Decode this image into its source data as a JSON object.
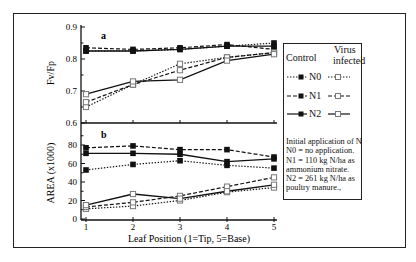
{
  "figure": {
    "panel_a_label": "a",
    "panel_b_label": "b",
    "ylabel_a": "Fv/Fp",
    "ylabel_b": "AREA (x1000)",
    "xlabel": "Leaf Position (1=Tip, 5=Base)"
  },
  "legend": {
    "control_header": "Control",
    "virus_header_line1": "Virus",
    "virus_header_line2": "infected",
    "rows": [
      {
        "label": "N0",
        "style": "dotted"
      },
      {
        "label": "N1",
        "style": "dash-dot"
      },
      {
        "label": "N2",
        "style": "solid"
      }
    ],
    "notes": [
      "Initial application of N",
      "N0 = no application.",
      "N1 = 110 kg N/ha as",
      "ammonium nitrate.",
      "N2 = 261 kg N/ha as",
      "poultry manure.,"
    ]
  },
  "colors": {
    "line": "#111111",
    "open_marker_edge": "#777777",
    "background": "#ffffff"
  },
  "chart_data": [
    {
      "type": "line",
      "panel": "a",
      "title": "a",
      "xlabel": "Leaf Position (1=Tip, 5=Base)",
      "ylabel": "Fv/Fp",
      "x": [
        1,
        2,
        3,
        4,
        5
      ],
      "ylim": [
        0.6,
        0.9
      ],
      "yticks": [
        "0.6",
        "0.7",
        "0.8",
        "0.9"
      ],
      "minor_yticks": [
        0.65,
        0.75,
        0.85
      ],
      "grid": false,
      "series": [
        {
          "name": "Control N0",
          "style": "dotted",
          "marker": "filled",
          "values": [
            0.825,
            0.825,
            0.83,
            0.84,
            0.85
          ]
        },
        {
          "name": "Control N1",
          "style": "dash-dot",
          "marker": "filled",
          "values": [
            0.835,
            0.83,
            0.835,
            0.845,
            0.83
          ]
        },
        {
          "name": "Control N2",
          "style": "solid",
          "marker": "filled",
          "values": [
            0.825,
            0.825,
            0.83,
            0.84,
            0.84
          ]
        },
        {
          "name": "Virus infected N0",
          "style": "dotted",
          "marker": "open",
          "values": [
            0.65,
            0.72,
            0.785,
            0.805,
            0.82
          ]
        },
        {
          "name": "Virus infected N1",
          "style": "dash-dot",
          "marker": "open",
          "values": [
            0.665,
            0.72,
            0.765,
            0.805,
            0.82
          ]
        },
        {
          "name": "Virus infected N2",
          "style": "solid",
          "marker": "open",
          "values": [
            0.69,
            0.73,
            0.735,
            0.795,
            0.815
          ]
        }
      ]
    },
    {
      "type": "line",
      "panel": "b",
      "title": "b",
      "xlabel": "Leaf Position (1=Tip, 5=Base)",
      "ylabel": "AREA (x1000)",
      "x": [
        1,
        2,
        3,
        4,
        5
      ],
      "xticks": [
        "1",
        "2",
        "3",
        "4",
        "5"
      ],
      "ylim": [
        0,
        100
      ],
      "yticks": [
        "0",
        "20",
        "40",
        "60",
        "80"
      ],
      "minor_yticks": [
        10,
        30,
        50,
        70,
        90
      ],
      "grid": false,
      "series": [
        {
          "name": "Control N0",
          "style": "dotted",
          "marker": "filled",
          "values": [
            53,
            59,
            63,
            58,
            55
          ]
        },
        {
          "name": "Control N1",
          "style": "dash-dot",
          "marker": "filled",
          "values": [
            77,
            79,
            75,
            75,
            67
          ]
        },
        {
          "name": "Control N2",
          "style": "solid",
          "marker": "filled",
          "values": [
            71,
            71,
            70,
            62,
            65
          ]
        },
        {
          "name": "Virus infected N0",
          "style": "dotted",
          "marker": "open",
          "values": [
            11,
            14,
            20,
            29,
            34
          ]
        },
        {
          "name": "Virus infected N1",
          "style": "dash-dot",
          "marker": "open",
          "values": [
            13,
            18,
            25,
            35,
            45
          ]
        },
        {
          "name": "Virus infected N2",
          "style": "solid",
          "marker": "open",
          "values": [
            15,
            27,
            22,
            30,
            37
          ]
        }
      ]
    }
  ]
}
